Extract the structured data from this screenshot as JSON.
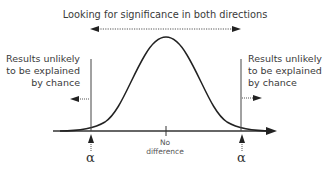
{
  "diagram": {
    "title": "Looking for significance in both directions",
    "left_note": [
      "Results unlikely",
      "to be explained",
      "by chance"
    ],
    "right_note": [
      "Results unlikely",
      "to be explained",
      "by chance"
    ],
    "center_label": [
      "No",
      "difference"
    ],
    "left_alpha": "α",
    "right_alpha": "α",
    "type": "two-tailed normal distribution with rejection regions",
    "colors": {
      "curve": "#222222",
      "axis": "#333333",
      "text": "#3a3a3a",
      "dotted": "#555555"
    }
  }
}
